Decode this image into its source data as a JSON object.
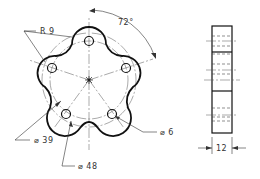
{
  "drawing": {
    "title": "Five-lobed plate with holes — front and side views",
    "front_view": {
      "center": [
        89,
        80
      ],
      "bolt_circle_radius_px": 39,
      "lobe_radius_px": 17,
      "hole_radius_px": 4.5,
      "angles_deg": [
        -90,
        -18,
        54,
        126,
        198
      ],
      "labels": {
        "lobe_radius": "R 9",
        "angle": "72°",
        "hole_diameter": "⌀ 6",
        "bolt_circle_diameter": "⌀ 39",
        "outer_circle_diameter": "⌀ 48"
      }
    },
    "side_view": {
      "labels": {
        "thickness": "12"
      }
    }
  }
}
